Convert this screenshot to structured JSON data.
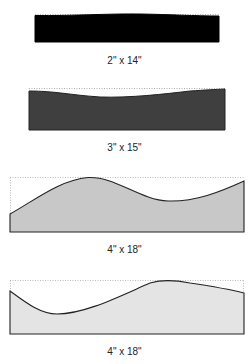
{
  "diagram": {
    "type": "baseboard-profiles",
    "panels": [
      {
        "id": "panel-1",
        "label": "2\" x 14\"",
        "fill": "#000000",
        "stroke": "#000000"
      },
      {
        "id": "panel-2",
        "label": "3\" x 15\"",
        "fill": "#3f3f3f",
        "stroke": "#222222"
      },
      {
        "id": "panel-3",
        "label": "4\" x 18\"",
        "fill": "#c8c8c8",
        "stroke": "#222222"
      },
      {
        "id": "panel-4",
        "label": "4\" x 18\"",
        "fill": "#e4e4e4",
        "stroke": "#222222"
      }
    ]
  }
}
